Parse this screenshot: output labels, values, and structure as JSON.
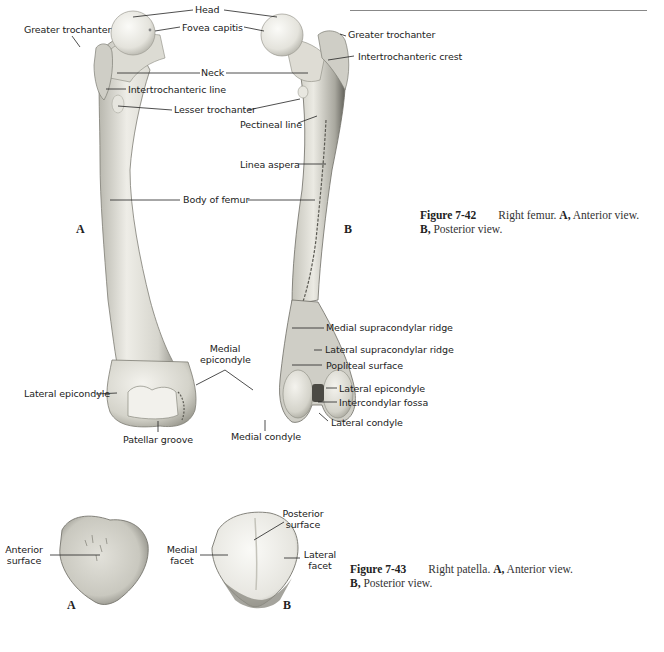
{
  "figure_42": {
    "number": "Figure 7-42",
    "caption_line1": "Right femur.",
    "view_a_marker": "A,",
    "view_a_text": "Anterior view.",
    "view_b_marker": "B,",
    "view_b_text": "Posterior view.",
    "panel_a_label": "A",
    "panel_b_label": "B",
    "labels": {
      "head": "Head",
      "fovea_capitis": "Fovea capitis",
      "greater_trochanter_a": "Greater trochanter",
      "greater_trochanter_b": "Greater trochanter",
      "intertrochanteric_crest": "Intertrochanteric crest",
      "neck": "Neck",
      "intertrochanteric_line": "Intertrochanteric line",
      "lesser_trochanter": "Lesser trochanter",
      "pectineal_line": "Pectineal line",
      "linea_aspera": "Linea aspera",
      "body_of_femur": "Body of femur",
      "medial_supracondylar_ridge": "Medial supracondylar ridge",
      "lateral_supracondylar_ridge": "Lateral supracondylar ridge",
      "medial_epicondyle_1": "Medial",
      "medial_epicondyle_2": "epicondyle",
      "popliteal_surface": "Popliteal surface",
      "lateral_epicondyle_a": "Lateral epicondyle",
      "lateral_epicondyle_b": "Lateral epicondyle",
      "intercondylar_fossa": "Intercondylar fossa",
      "lateral_condyle": "Lateral condyle",
      "patellar_groove": "Patellar groove",
      "medial_condyle": "Medial condyle"
    }
  },
  "figure_43": {
    "number": "Figure 7-43",
    "caption_line1": "Right patella.",
    "view_a_marker": "A,",
    "view_a_text": "Anterior view.",
    "view_b_marker": "B,",
    "view_b_text": "Posterior view.",
    "panel_a_label": "A",
    "panel_b_label": "B",
    "labels": {
      "anterior_surface_1": "Anterior",
      "anterior_surface_2": "surface",
      "posterior_surface_1": "Posterior",
      "posterior_surface_2": "surface",
      "medial_facet_1": "Medial",
      "medial_facet_2": "facet",
      "lateral_facet_1": "Lateral",
      "lateral_facet_2": "facet"
    }
  },
  "colors": {
    "bone_light": "#ecebe4",
    "bone_mid": "#c9c8bf",
    "bone_dark": "#8a8980",
    "leader": "#222222",
    "rule": "#888888"
  }
}
